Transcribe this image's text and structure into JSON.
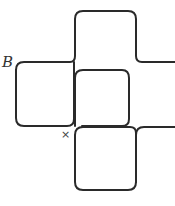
{
  "diagram": {
    "labels": {
      "point_b": "B",
      "cross_marker": "×"
    },
    "stroke_color": "#2a2a2a"
  }
}
